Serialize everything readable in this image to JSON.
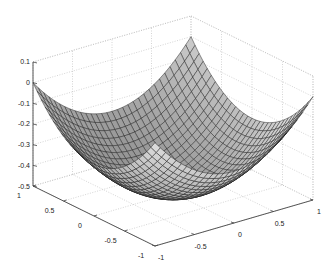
{
  "chart_data": {
    "type": "surface3d",
    "title": "",
    "xlabel": "",
    "ylabel": "",
    "zlabel": "",
    "function": "z = (x^2 + y^2)/4 - 0.5",
    "x_range": [
      -1,
      1
    ],
    "y_range": [
      -1,
      1
    ],
    "zlim": [
      -0.5,
      0.1
    ],
    "mesh_resolution": 31,
    "x_ticks": [
      -1,
      -0.5,
      0,
      0.5,
      1
    ],
    "x_tick_labels": [
      "-1",
      "-0.5",
      "0",
      "0.5",
      "1"
    ],
    "y_ticks": [
      -1,
      -0.5,
      0,
      0.5,
      1
    ],
    "y_tick_labels": [
      "-1",
      "-0.5",
      "0",
      "0.5",
      "1"
    ],
    "z_ticks": [
      -0.5,
      -0.4,
      -0.3,
      -0.2,
      -0.1,
      0,
      0.1
    ],
    "z_tick_labels": [
      "-0.5",
      "-0.4",
      "-0.3",
      "-0.2",
      "-0.1",
      "0",
      "0.1"
    ],
    "grid": true,
    "colormap": "gray",
    "sample_values": [
      {
        "x": 0,
        "y": 0,
        "z": -0.5
      },
      {
        "x": 1,
        "y": 0,
        "z": -0.25
      },
      {
        "x": 0,
        "y": 1,
        "z": -0.25
      },
      {
        "x": 1,
        "y": 1,
        "z": 0
      },
      {
        "x": -1,
        "y": -1,
        "z": 0
      },
      {
        "x": 1,
        "y": -1,
        "z": 0
      },
      {
        "x": -1,
        "y": 1,
        "z": 0
      }
    ]
  },
  "projection": {
    "origin": [
      173,
      193,
      -0.5
    ],
    "ex": [
      79,
      -23
    ],
    "ey": [
      -61,
      -30
    ],
    "ez_per_unit": -206.7
  },
  "colors": {
    "background": "#ffffff",
    "axis": "#444444",
    "grid": "#b9b9b9",
    "mesh_edge": "#1a1a1a",
    "surface_low": "#3a3a3a",
    "surface_high": "#e6e6e6"
  }
}
